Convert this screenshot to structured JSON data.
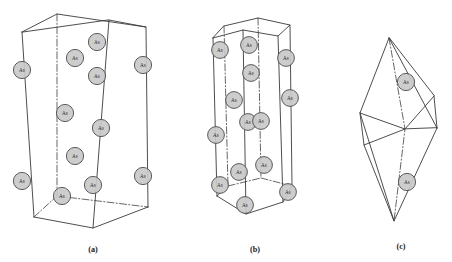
{
  "figure": {
    "background_color": "#ffffff",
    "line_color": "#3a3a3a",
    "atom_fill_color": "#c9c9c9",
    "atom_stroke_color": "#4c4c4c",
    "atom_label_color": "#2b2b2b"
  },
  "panels": [
    {
      "id": "a",
      "caption": "(a)",
      "caption_x": 93,
      "caption_y": 252,
      "shape": "orthorhombic-prism",
      "atom_count": 12,
      "vertices": {
        "front_top_left": [
          22,
          32
        ],
        "front_top_right": [
          109,
          20
        ],
        "back_top_right": [
          146,
          27
        ],
        "back_top_left": [
          57,
          14
        ],
        "front_bottom_left": [
          34,
          217
        ],
        "front_bottom_right": [
          93,
          228
        ],
        "back_bottom_right": [
          148,
          207
        ],
        "back_bottom_left": [
          57,
          196
        ]
      },
      "atoms": [
        {
          "label": "As",
          "x": 22,
          "y": 70,
          "r": 8.6
        },
        {
          "label": "As",
          "x": 22,
          "y": 181,
          "r": 8.6
        },
        {
          "label": "As",
          "x": 75,
          "y": 58,
          "r": 8.6
        },
        {
          "label": "As",
          "x": 75,
          "y": 156,
          "r": 8.6
        },
        {
          "label": "As",
          "x": 62,
          "y": 196,
          "r": 8.6
        },
        {
          "label": "As",
          "x": 93,
          "y": 185,
          "r": 8.6
        },
        {
          "label": "As",
          "x": 97,
          "y": 42,
          "r": 8.6
        },
        {
          "label": "As",
          "x": 97,
          "y": 76,
          "r": 8.6
        },
        {
          "label": "As",
          "x": 101,
          "y": 128,
          "r": 8.6
        },
        {
          "label": "As",
          "x": 65,
          "y": 113,
          "r": 8.6
        },
        {
          "label": "As",
          "x": 143,
          "y": 65,
          "r": 8.6
        },
        {
          "label": "As",
          "x": 143,
          "y": 176,
          "r": 8.6
        }
      ]
    },
    {
      "id": "b",
      "caption": "(b)",
      "caption_x": 255,
      "caption_y": 252,
      "shape": "hexagonal-prism",
      "atom_count": 14,
      "vertices": {
        "front_top_left": [
          213,
          38
        ],
        "front_top_mid": [
          243,
          30
        ],
        "front_top_right": [
          278,
          36
        ],
        "back_top_right": [
          290,
          25
        ],
        "back_top_mid": [
          258,
          18
        ],
        "back_top_left": [
          224,
          26
        ],
        "front_bottom_left": [
          217,
          196
        ],
        "front_bottom_mid": [
          246,
          214
        ],
        "front_bottom_right": [
          283,
          202
        ],
        "back_bottom_right": [
          292,
          186
        ],
        "back_bottom_mid": [
          261,
          178
        ],
        "back_bottom_left": [
          228,
          186
        ]
      },
      "atoms": [
        {
          "label": "As",
          "x": 220,
          "y": 50,
          "r": 8.4
        },
        {
          "label": "As",
          "x": 220,
          "y": 185,
          "r": 8.4
        },
        {
          "label": "As",
          "x": 216,
          "y": 135,
          "r": 8.4
        },
        {
          "label": "As",
          "x": 234,
          "y": 100,
          "r": 8.4
        },
        {
          "label": "As",
          "x": 239,
          "y": 172,
          "r": 8.4
        },
        {
          "label": "As",
          "x": 245,
          "y": 205,
          "r": 8.4
        },
        {
          "label": "As",
          "x": 249,
          "y": 45,
          "r": 8.4
        },
        {
          "label": "As",
          "x": 251,
          "y": 73,
          "r": 8.4
        },
        {
          "label": "As",
          "x": 248,
          "y": 122,
          "r": 8.4
        },
        {
          "label": "As",
          "x": 261,
          "y": 121,
          "r": 8.4
        },
        {
          "label": "As",
          "x": 264,
          "y": 165,
          "r": 8.4
        },
        {
          "label": "As",
          "x": 286,
          "y": 58,
          "r": 8.4
        },
        {
          "label": "As",
          "x": 290,
          "y": 98,
          "r": 8.4
        },
        {
          "label": "As",
          "x": 288,
          "y": 192,
          "r": 8.4
        }
      ]
    },
    {
      "id": "c",
      "caption": "(c)",
      "caption_x": 401,
      "caption_y": 249,
      "shape": "rhombohedron",
      "atom_count": 2,
      "vertices": {
        "top": [
          389,
          38
        ],
        "upper_left": [
          360,
          113
        ],
        "upper_right": [
          434,
          96
        ],
        "mid": [
          405,
          129
        ],
        "lower_left": [
          364,
          145
        ],
        "lower_right": [
          437,
          128
        ],
        "bottom": [
          394,
          221
        ]
      },
      "atoms": [
        {
          "label": "As",
          "x": 406,
          "y": 82,
          "r": 8.6
        },
        {
          "label": "As",
          "x": 407,
          "y": 182,
          "r": 8.6
        }
      ]
    }
  ]
}
